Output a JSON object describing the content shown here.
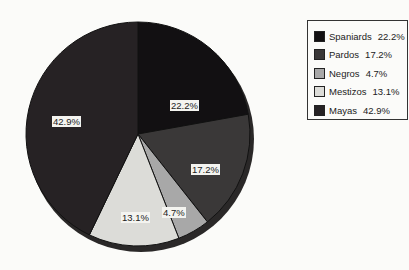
{
  "chart_data": {
    "type": "pie",
    "title": "",
    "categories": [
      "Spaniards",
      "Pardos",
      "Negros",
      "Mestizos",
      "Mayas"
    ],
    "values": [
      22.2,
      17.2,
      4.7,
      13.1,
      42.9
    ],
    "labels": [
      "22.2%",
      "17.2%",
      "4.7%",
      "13.1%",
      "42.9%"
    ],
    "colors": [
      "#121012",
      "#3a3838",
      "#a8a8a8",
      "#dcdcd8",
      "#262224"
    ],
    "start_angle_deg": 0,
    "direction": "clockwise",
    "legend_position": "right",
    "legend": [
      {
        "name": "Spaniards",
        "value": "22.2%"
      },
      {
        "name": "Pardos",
        "value": "17.2%"
      },
      {
        "name": "Negros",
        "value": "4.7%"
      },
      {
        "name": "Mestizos",
        "value": "13.1%"
      },
      {
        "name": "Mayas",
        "value": "42.9%"
      }
    ]
  }
}
